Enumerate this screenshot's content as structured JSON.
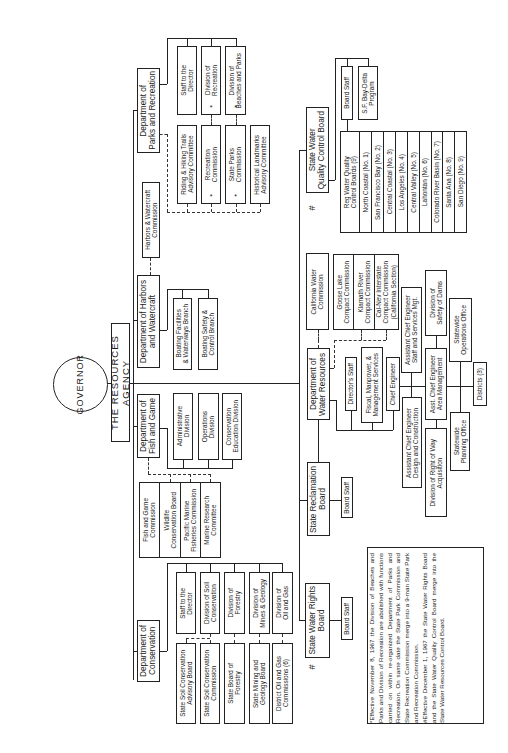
{
  "governor": "GOVERNOR",
  "agency": "THE RESOURCES AGENCY",
  "markers": {
    "asterisk": "*",
    "hash": "#"
  },
  "parks": {
    "dept": "Department of\nParks and Recreation",
    "units": [
      "Staff to the\nDirector",
      "Division of\nRecreation",
      "Division of\nBeaches and Parks"
    ],
    "commissions": [
      "Riding & Hiking Trails\nAdvisory Committee",
      "Recreation\nCommission",
      "State Parks\nCommission",
      "Historical Landmarks\nAdvisory Committee"
    ]
  },
  "harbors": {
    "commission": "Harbors & Watercraft\nCommission",
    "dept": "Department of Harbors\nand Watercraft",
    "units": [
      "Boating Facilities\n& Waterways Branch",
      "Boating Safety &\nControl Branch"
    ]
  },
  "fishgame": {
    "dept": "Department of\nFish and Game",
    "units": [
      "Administrative\nDivision",
      "Operations\nDivision",
      "Conservation\nEducation Division"
    ],
    "commissions": [
      "Fish and Game\nCommission",
      "Wildlife\nConservation Board",
      "Pacific Marine\nFisheries Commission",
      "Marine Research\nCommittee"
    ]
  },
  "conservation": {
    "dept": "Department of\nConservation",
    "units": [
      "Staff to the\nDirector",
      "Division of Soil\nConservation",
      "Division of\nForestry",
      "Division of\nMines & Geology",
      "Division of\nOil and Gas"
    ],
    "boards": [
      "State Soil Conservation\nAdvisory Board",
      "State Soil Conservation\nCommission",
      "State Board of\nForestry",
      "State Mining and\nGeology Board",
      "District Oil and Gas\nCommissions (6)"
    ]
  },
  "qcb": {
    "dept": "State Water\nQuality Control Board",
    "units": [
      "Board Staff",
      "S.F. Bay-Delta\nProgram"
    ],
    "regional": [
      "Reg Water Quality\nControl Boards (9)",
      "North Coastal (No. 1)",
      "San Francisco Bay (No. 2)",
      "Central Coastal (No. 3)",
      "Los Angeles (No. 4)",
      "Central Valley (No. 5)",
      "Lahontan (No. 6)",
      "Colorado River Basin (No. 7)",
      "Santa Ana (No. 8)",
      "San Diego (No. 9)"
    ]
  },
  "water": {
    "commission": "California Water\nCommission",
    "compacts": [
      "Goose Lake\nCompact Commission",
      "Klamath River\nCompact Commission",
      "Cal-Nev Interstate\nCompact Commission\n(California Section)"
    ],
    "dept": "Department of\nWater Resources",
    "directors_staff": "Director's Staff",
    "fiscal": "Fiscal, Manpower, &\nManagement Services",
    "chief": "Chief Engineer",
    "ace_staff": "Assistant Chief Engineer\nStaff and Services Mgt.",
    "safety_dams": "Division of\nSafety of Dams",
    "ops_office": "Statewide\nOperations Office",
    "ace_area": "Asst. Chief Engineer\nArea Management",
    "districts": "Districts (3)",
    "planning": "Statewide\nPlanning Office",
    "ace_design": "Assistant Chief Engineer\nDesign and Construction",
    "row": "Division of Right of Way\nAcquisition"
  },
  "reclamation": {
    "dept": "State Reclamation\nBoard",
    "staff": "Board Staff"
  },
  "rights": {
    "dept": "State Water Rights\nBoard",
    "staff": "Board Staff"
  },
  "notes": [
    "*Effective November 8, 1967 the Division of Beaches and Parks and Division of Recreation are abolished with functions carried on within re-organized Department of Parks and Recreation. On same date the State Park Commission and State Recreation Commission merge into a 9-man State Park and Recreation Commission.",
    "#Effective December 1, 1967 the State Water Rights Board and the State Water Quality Control Board merge into the State Water Resources Control Board."
  ]
}
